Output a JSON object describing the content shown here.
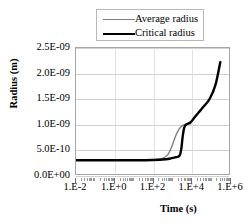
{
  "chart_data": {
    "type": "line",
    "title": "",
    "xlabel": "Time (s)",
    "ylabel": "Radius (m)",
    "xscale": "log",
    "yscale": "linear",
    "xlim": [
      0.01,
      1000000
    ],
    "ylim": [
      0.0,
      2.5e-09
    ],
    "grid": "horizontal",
    "legend_position": "top-center",
    "xtick_labels": [
      "1.E-2",
      "1.E+0",
      "1.E+2",
      "1.E+4",
      "1.E+6"
    ],
    "xtick_values": [
      0.01,
      1,
      100,
      10000,
      1000000
    ],
    "ytick_labels": [
      "0.0E+00",
      "5.0E-10",
      "1.0E-09",
      "1.5E-09",
      "2.0E-09",
      "2.5E-09"
    ],
    "ytick_values": [
      0,
      5e-10,
      1e-09,
      1.5e-09,
      2e-09,
      2.5e-09
    ],
    "series": [
      {
        "name": "Average radius",
        "color": "#7f7f7f",
        "width": 1.4,
        "x": [
          0.01,
          0.1,
          1,
          10,
          100,
          300,
          600,
          900,
          1300,
          1800,
          2500,
          3500,
          5000,
          7000,
          10000
        ],
        "y": [
          2.8e-10,
          2.8e-10,
          2.8e-10,
          2.8e-10,
          2.85e-10,
          3.1e-10,
          3.8e-10,
          5e-10,
          6.6e-10,
          8e-10,
          9e-10,
          9.6e-10,
          9.9e-10,
          1e-09,
          1e-09
        ]
      },
      {
        "name": "Critical radius",
        "color": "#000000",
        "width": 2.4,
        "x": [
          0.01,
          0.1,
          1,
          10,
          100,
          500,
          1000,
          1800,
          2600,
          3200,
          3800,
          4600,
          6000,
          9000,
          14000,
          25000,
          50000,
          100000,
          200000,
          350000
        ],
        "y": [
          2.8e-10,
          2.8e-10,
          2.8e-10,
          2.8e-10,
          2.85e-10,
          3e-10,
          3.2e-10,
          3.4e-10,
          3.7e-10,
          5e-10,
          7.5e-10,
          9.3e-10,
          9.9e-10,
          1.02e-09,
          1.1e-09,
          1.22e-09,
          1.35e-09,
          1.5e-09,
          1.78e-09,
          2.22e-09
        ]
      }
    ]
  },
  "legend": {
    "items": [
      {
        "label": "Average radius"
      },
      {
        "label": "Critical radius"
      }
    ]
  },
  "axes": {
    "x_title": "Time (s)",
    "y_title": "Radius (m)"
  }
}
